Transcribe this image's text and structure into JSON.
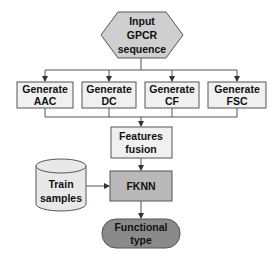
{
  "diagram": {
    "type": "flowchart",
    "colors": {
      "input_fill": "#cfcfcf",
      "generate_fill": "#f0f0f0",
      "fusion_fill": "#f0f0f0",
      "fknn_fill": "#b9b9b9",
      "output_fill": "#8a8a8a",
      "train_fill": "#e8e8e8",
      "stroke": "#555555"
    },
    "nodes": {
      "input": {
        "line1": "Input",
        "line2": "GPCR",
        "line3": "sequence",
        "shape": "hexagon"
      },
      "generate": [
        {
          "line1": "Generate",
          "line2": "AAC"
        },
        {
          "line1": "Generate",
          "line2": "DC"
        },
        {
          "line1": "Generate",
          "line2": "CF"
        },
        {
          "line1": "Generate",
          "line2": "FSC"
        }
      ],
      "fusion": {
        "line1": "Features",
        "line2": "fusion"
      },
      "train": {
        "line1": "Train",
        "line2": "samples",
        "shape": "cylinder"
      },
      "fknn": {
        "label": "FKNN"
      },
      "output": {
        "line1": "Functional",
        "line2": "type",
        "shape": "rounded"
      }
    },
    "edges": [
      [
        "input",
        "generate_aac"
      ],
      [
        "input",
        "generate_dc"
      ],
      [
        "input",
        "generate_cf"
      ],
      [
        "input",
        "generate_fsc"
      ],
      [
        "generate_aac",
        "fusion"
      ],
      [
        "generate_dc",
        "fusion"
      ],
      [
        "generate_cf",
        "fusion"
      ],
      [
        "generate_fsc",
        "fusion"
      ],
      [
        "fusion",
        "fknn"
      ],
      [
        "train",
        "fknn"
      ],
      [
        "fknn",
        "output"
      ]
    ]
  }
}
